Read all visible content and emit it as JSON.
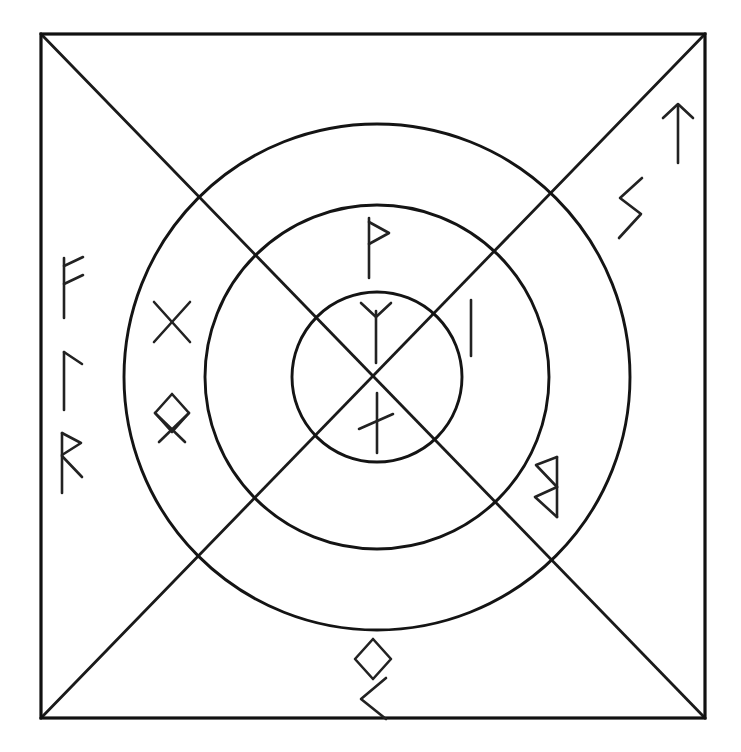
{
  "figure": {
    "background_color": "#ffffff",
    "ink_color": "#111111"
  },
  "frame": {
    "name": "outer-square",
    "left": 41,
    "top": 34,
    "right": 705,
    "bottom": 718,
    "stroke_color": "#111111",
    "stroke_width": 3.2
  },
  "diagonals": [
    {
      "name": "diagonal-tl-br",
      "x1": 41,
      "y1": 34,
      "x2": 705,
      "y2": 718
    },
    {
      "name": "diagonal-tr-bl",
      "x1": 705,
      "y1": 34,
      "x2": 41,
      "y2": 718
    }
  ],
  "center": {
    "cx": 377,
    "cy": 377
  },
  "rings": [
    {
      "name": "outer-ring",
      "radius": 253,
      "stroke_width": 2.9
    },
    {
      "name": "middle-ring",
      "radius": 172,
      "stroke_width": 2.9
    },
    {
      "name": "inner-ring",
      "radius": 85,
      "stroke_width": 2.9
    }
  ],
  "runes": [
    {
      "id": "fehu",
      "name": "rune-fehu",
      "glyph": "ᚠ",
      "transliteration": "F",
      "zone": "outer-left",
      "x": 70,
      "y": 288,
      "scale": 1.0,
      "rotation": 0
    },
    {
      "id": "laguz",
      "name": "rune-laguz",
      "glyph": "ᛚ",
      "transliteration": "L",
      "zone": "outer-left",
      "x": 70,
      "y": 380,
      "scale": 1.0,
      "rotation": 0
    },
    {
      "id": "raido",
      "name": "rune-raido",
      "glyph": "ᚱ",
      "transliteration": "R",
      "zone": "outer-left",
      "x": 70,
      "y": 463,
      "scale": 1.0,
      "rotation": 0
    },
    {
      "id": "tiwaz",
      "name": "rune-tiwaz",
      "glyph": "ᛏ",
      "transliteration": "T",
      "zone": "outer-upper-right",
      "x": 678,
      "y": 135,
      "scale": 1.0,
      "rotation": 0
    },
    {
      "id": "sowilo",
      "name": "rune-sowilo",
      "glyph": "ᛊ",
      "transliteration": "S",
      "zone": "outer-upper-right",
      "x": 629,
      "y": 208,
      "scale": 1.0,
      "rotation": 0
    },
    {
      "id": "berkana",
      "name": "rune-berkana-mirrored",
      "glyph": "ᛒ",
      "transliteration": "B",
      "zone": "outer-right",
      "x": 545,
      "y": 487,
      "scale": 1.0,
      "rotation": 0
    },
    {
      "id": "ingwaz",
      "name": "rune-ingwaz",
      "glyph": "ᛜ",
      "transliteration": "NG",
      "zone": "outer-bottom",
      "x": 373,
      "y": 659,
      "scale": 1.0,
      "rotation": 0
    },
    {
      "id": "kenaz",
      "name": "rune-kenaz",
      "glyph": "ᚲ",
      "transliteration": "K",
      "zone": "outer-bottom",
      "x": 372,
      "y": 698,
      "scale": 1.0,
      "rotation": 0
    },
    {
      "id": "gebo",
      "name": "rune-gebo",
      "glyph": "ᚷ",
      "transliteration": "G",
      "zone": "middle-left",
      "x": 172,
      "y": 322,
      "scale": 1.0,
      "rotation": 0
    },
    {
      "id": "inguz-crossed",
      "name": "rune-inguz-crossed",
      "glyph": "ᛝ",
      "transliteration": "NG",
      "zone": "middle-left",
      "x": 172,
      "y": 420,
      "scale": 1.0,
      "rotation": 0
    },
    {
      "id": "thurisaz",
      "name": "rune-thurisaz",
      "glyph": "ᚦ",
      "transliteration": "TH",
      "zone": "middle-top",
      "x": 376,
      "y": 248,
      "scale": 1.0,
      "rotation": 0
    },
    {
      "id": "isa",
      "name": "rune-isa",
      "glyph": "ᛁ",
      "transliteration": "I",
      "zone": "middle-right",
      "x": 471,
      "y": 328,
      "scale": 1.0,
      "rotation": 0
    },
    {
      "id": "algiz",
      "name": "rune-algiz",
      "glyph": "ᛉ",
      "transliteration": "Z",
      "zone": "center",
      "x": 376,
      "y": 333,
      "scale": 1.0,
      "rotation": 0
    },
    {
      "id": "nauthiz",
      "name": "rune-nauthiz",
      "glyph": "ᚾ",
      "transliteration": "N",
      "zone": "center",
      "x": 376,
      "y": 423,
      "scale": 1.0,
      "rotation": 0
    }
  ]
}
